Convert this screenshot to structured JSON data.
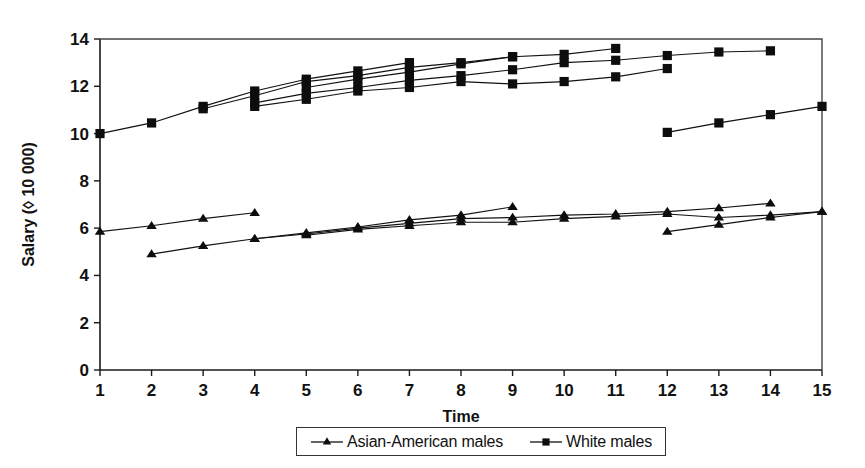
{
  "chart_data": {
    "type": "line",
    "title": "",
    "xlabel": "Time",
    "ylabel": "Salary (◊ 10 000)",
    "xlim": [
      1,
      15
    ],
    "ylim": [
      0,
      14
    ],
    "xticks": [
      "1",
      "2",
      "3",
      "4",
      "5",
      "6",
      "7",
      "8",
      "9",
      "10",
      "11",
      "12",
      "13",
      "14",
      "15"
    ],
    "yticks": [
      "0",
      "2",
      "4",
      "6",
      "8",
      "10",
      "12",
      "14"
    ],
    "grid": false,
    "legend_position": "bottom-center",
    "legend": [
      {
        "label": "Asian-American males",
        "marker": "triangle"
      },
      {
        "label": "White males",
        "marker": "square"
      }
    ],
    "series": [
      {
        "name": "White males cohort A",
        "group": "White males",
        "marker": "square",
        "x": [
          1,
          2,
          3,
          4,
          5,
          6,
          7
        ],
        "values": [
          10.0,
          10.45,
          11.15,
          11.8,
          12.3,
          12.65,
          13.0
        ]
      },
      {
        "name": "White males cohort B",
        "group": "White males",
        "marker": "square",
        "x": [
          3,
          4,
          5,
          6,
          7,
          8,
          9
        ],
        "values": [
          11.05,
          11.6,
          12.2,
          12.45,
          12.8,
          13.0,
          13.25
        ]
      },
      {
        "name": "White males cohort C",
        "group": "White males",
        "marker": "square",
        "x": [
          5,
          6,
          7,
          8,
          9,
          10,
          11
        ],
        "values": [
          11.95,
          12.3,
          12.6,
          12.95,
          13.25,
          13.35,
          13.6
        ]
      },
      {
        "name": "White males cohort D",
        "group": "White males",
        "marker": "square",
        "x": [
          4,
          5,
          6,
          7,
          8,
          9,
          10,
          11,
          12,
          13,
          14
        ],
        "values": [
          11.3,
          11.7,
          11.95,
          12.25,
          12.45,
          12.7,
          13.0,
          13.1,
          13.3,
          13.45,
          13.5
        ]
      },
      {
        "name": "White males cohort E",
        "group": "White males",
        "marker": "square",
        "x": [
          4,
          5,
          6,
          7,
          8,
          9,
          10,
          11,
          12
        ],
        "values": [
          11.15,
          11.45,
          11.8,
          11.95,
          12.2,
          12.1,
          12.2,
          12.4,
          12.75
        ]
      },
      {
        "name": "White males cohort F",
        "group": "White males",
        "marker": "square",
        "x": [
          12,
          13,
          14,
          15
        ],
        "values": [
          10.05,
          10.45,
          10.8,
          11.15
        ]
      },
      {
        "name": "Asian-American males cohort A",
        "group": "Asian-American males",
        "marker": "triangle",
        "x": [
          1,
          2,
          3,
          4
        ],
        "values": [
          5.85,
          6.1,
          6.4,
          6.65
        ]
      },
      {
        "name": "Asian-American males cohort B",
        "group": "Asian-American males",
        "marker": "triangle",
        "x": [
          2,
          3,
          4,
          5,
          6,
          7,
          8,
          9
        ],
        "values": [
          4.9,
          5.25,
          5.55,
          5.8,
          6.05,
          6.35,
          6.55,
          6.9
        ]
      },
      {
        "name": "Asian-American males cohort C",
        "group": "Asian-American males",
        "marker": "triangle",
        "x": [
          4,
          5,
          6,
          7,
          8,
          9,
          10,
          11,
          12,
          13,
          14
        ],
        "values": [
          5.55,
          5.75,
          6.0,
          6.2,
          6.4,
          6.45,
          6.55,
          6.6,
          6.7,
          6.85,
          7.05
        ]
      },
      {
        "name": "Asian-American males cohort D",
        "group": "Asian-American males",
        "marker": "triangle",
        "x": [
          5,
          6,
          7,
          8,
          9,
          10,
          11,
          12,
          13,
          14,
          15
        ],
        "values": [
          5.7,
          5.95,
          6.1,
          6.25,
          6.25,
          6.4,
          6.5,
          6.6,
          6.45,
          6.55,
          6.7
        ]
      },
      {
        "name": "Asian-American males cohort E",
        "group": "Asian-American males",
        "marker": "triangle",
        "x": [
          12,
          13,
          14,
          15
        ],
        "values": [
          5.85,
          6.15,
          6.45,
          6.7
        ]
      }
    ]
  },
  "colors": {
    "ink": "#111111",
    "frame": "#444444",
    "background": "#ffffff"
  }
}
